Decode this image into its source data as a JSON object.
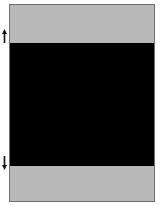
{
  "diagram": {
    "frame": {
      "border_color": "#6e6e6e"
    },
    "bands": [
      {
        "name": "top",
        "color": "#b9b9b9"
      },
      {
        "name": "middle",
        "color": "#000000"
      },
      {
        "name": "bottom",
        "color": "#b9b9b9"
      }
    ],
    "markers": [
      {
        "name": "up-arrow",
        "direction": "up"
      },
      {
        "name": "down-arrow",
        "direction": "down"
      }
    ]
  }
}
